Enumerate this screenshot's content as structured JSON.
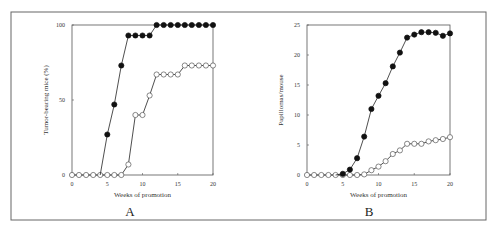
{
  "figure": {
    "frame": {
      "x": 11,
      "y": 12,
      "w": 475,
      "h": 208,
      "color": "#666666"
    },
    "panels": [
      {
        "label": "A",
        "label_x": 130,
        "label_y": 216
      },
      {
        "label": "B",
        "label_x": 369,
        "label_y": 216
      }
    ]
  },
  "chart_data": [
    {
      "type": "line",
      "panel": "A",
      "title": "",
      "xlabel": "Weeks of promotion",
      "ylabel": "Tumor-bearing mice (%)",
      "xlim": [
        0,
        20
      ],
      "ylim": [
        0,
        100
      ],
      "xticks": [
        0,
        5,
        10,
        15,
        20
      ],
      "yticks": [
        0,
        50,
        100
      ],
      "grid": false,
      "legend": null,
      "plot_box": {
        "x0": 72,
        "x1": 213,
        "y0": 175,
        "y1": 25
      },
      "x": [
        0,
        1,
        2,
        3,
        4,
        5,
        6,
        7,
        8,
        9,
        10,
        11,
        12,
        13,
        14,
        15,
        16,
        17,
        18,
        19,
        20
      ],
      "series": [
        {
          "name": "filled",
          "marker": "filled-circle",
          "values": [
            0,
            0,
            0,
            0,
            0,
            27,
            47,
            73,
            93,
            93,
            93,
            93,
            100,
            100,
            100,
            100,
            100,
            100,
            100,
            100,
            100
          ],
          "start_index": 4,
          "marker_start": 5
        },
        {
          "name": "open",
          "marker": "open-circle",
          "values": [
            0,
            0,
            0,
            0,
            0,
            0,
            0,
            0,
            7,
            40,
            40,
            53,
            67,
            67,
            67,
            67,
            73,
            73,
            73,
            73,
            73
          ],
          "start_index": 0,
          "marker_start": 0
        }
      ]
    },
    {
      "type": "line",
      "panel": "B",
      "title": "",
      "xlabel": "Weeks of promotion",
      "ylabel": "Papillomas/mouse",
      "xlim": [
        0,
        20
      ],
      "ylim": [
        0,
        25
      ],
      "xticks": [
        0,
        5,
        10,
        15,
        20
      ],
      "yticks": [
        0,
        5,
        10,
        15,
        20,
        25
      ],
      "grid": false,
      "legend": null,
      "plot_box": {
        "x0": 307,
        "x1": 450,
        "y0": 175,
        "y1": 25
      },
      "x": [
        0,
        1,
        2,
        3,
        4,
        5,
        6,
        7,
        8,
        9,
        10,
        11,
        12,
        13,
        14,
        15,
        16,
        17,
        18,
        19,
        20
      ],
      "series": [
        {
          "name": "filled",
          "marker": "filled-circle",
          "values": [
            0,
            0,
            0,
            0,
            0,
            0.2,
            0.9,
            2.8,
            6.4,
            11.0,
            13.2,
            15.3,
            18.1,
            20.4,
            22.9,
            23.4,
            23.8,
            23.8,
            23.7,
            23.2,
            23.6
          ],
          "start_index": 4,
          "marker_start": 5
        },
        {
          "name": "open",
          "marker": "open-circle",
          "values": [
            0,
            0,
            0,
            0,
            0,
            0,
            0,
            0,
            0.1,
            0.8,
            1.4,
            2.3,
            3.5,
            4.1,
            5.2,
            5.2,
            5.2,
            5.6,
            5.8,
            6.0,
            6.3
          ],
          "start_index": 0,
          "marker_start": 0
        }
      ]
    }
  ]
}
